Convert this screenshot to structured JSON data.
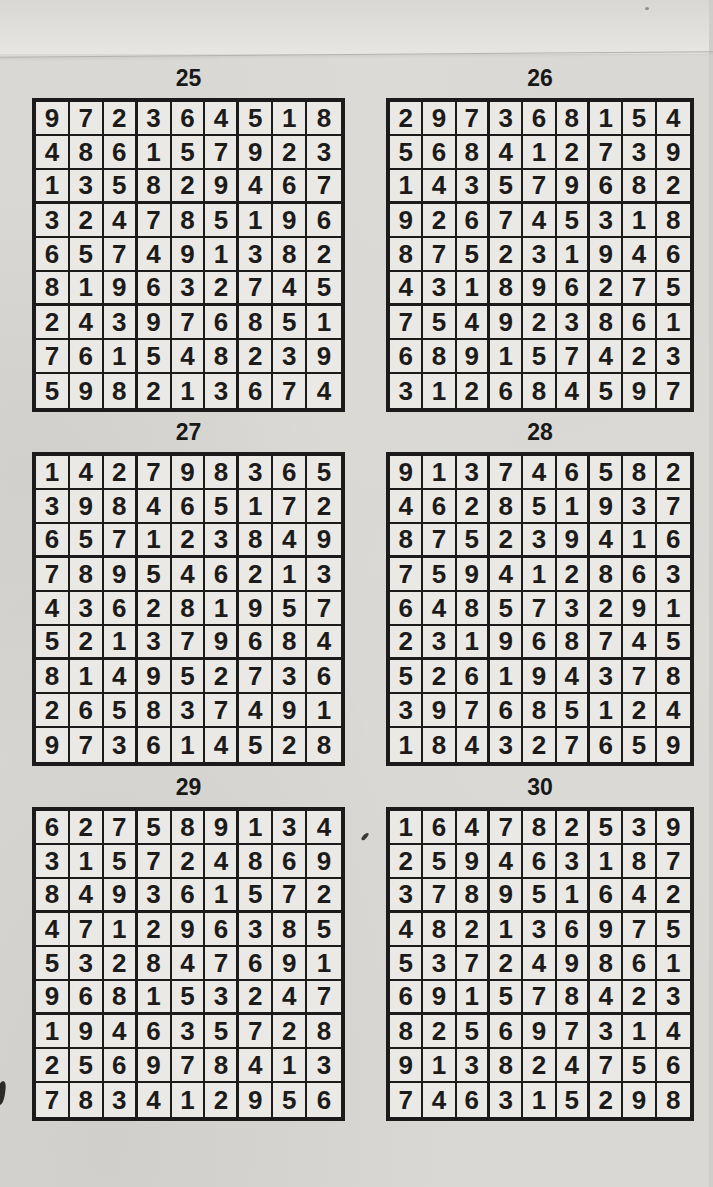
{
  "page": {
    "kind": "sudoku-solutions-page",
    "colors": {
      "paper": "#d9d8d5",
      "paper_top_band": "#e7e6e3",
      "ink": "#1b1b1b",
      "cell_fill": "#eae9e6"
    }
  },
  "puzzles": [
    {
      "number": "25",
      "rows": [
        [
          9,
          7,
          2,
          3,
          6,
          4,
          5,
          1,
          8
        ],
        [
          4,
          8,
          6,
          1,
          5,
          7,
          9,
          2,
          3
        ],
        [
          1,
          3,
          5,
          8,
          2,
          9,
          4,
          6,
          7
        ],
        [
          3,
          2,
          4,
          7,
          8,
          5,
          1,
          9,
          6
        ],
        [
          6,
          5,
          7,
          4,
          9,
          1,
          3,
          8,
          2
        ],
        [
          8,
          1,
          9,
          6,
          3,
          2,
          7,
          4,
          5
        ],
        [
          2,
          4,
          3,
          9,
          7,
          6,
          8,
          5,
          1
        ],
        [
          7,
          6,
          1,
          5,
          4,
          8,
          2,
          3,
          9
        ],
        [
          5,
          9,
          8,
          2,
          1,
          3,
          6,
          7,
          4
        ]
      ]
    },
    {
      "number": "26",
      "rows": [
        [
          2,
          9,
          7,
          3,
          6,
          8,
          1,
          5,
          4
        ],
        [
          5,
          6,
          8,
          4,
          1,
          2,
          7,
          3,
          9
        ],
        [
          1,
          4,
          3,
          5,
          7,
          9,
          6,
          8,
          2
        ],
        [
          9,
          2,
          6,
          7,
          4,
          5,
          3,
          1,
          8
        ],
        [
          8,
          7,
          5,
          2,
          3,
          1,
          9,
          4,
          6
        ],
        [
          4,
          3,
          1,
          8,
          9,
          6,
          2,
          7,
          5
        ],
        [
          7,
          5,
          4,
          9,
          2,
          3,
          8,
          6,
          1
        ],
        [
          6,
          8,
          9,
          1,
          5,
          7,
          4,
          2,
          3
        ],
        [
          3,
          1,
          2,
          6,
          8,
          4,
          5,
          9,
          7
        ]
      ]
    },
    {
      "number": "27",
      "rows": [
        [
          1,
          4,
          2,
          7,
          9,
          8,
          3,
          6,
          5
        ],
        [
          3,
          9,
          8,
          4,
          6,
          5,
          1,
          7,
          2
        ],
        [
          6,
          5,
          7,
          1,
          2,
          3,
          8,
          4,
          9
        ],
        [
          7,
          8,
          9,
          5,
          4,
          6,
          2,
          1,
          3
        ],
        [
          4,
          3,
          6,
          2,
          8,
          1,
          9,
          5,
          7
        ],
        [
          5,
          2,
          1,
          3,
          7,
          9,
          6,
          8,
          4
        ],
        [
          8,
          1,
          4,
          9,
          5,
          2,
          7,
          3,
          6
        ],
        [
          2,
          6,
          5,
          8,
          3,
          7,
          4,
          9,
          1
        ],
        [
          9,
          7,
          3,
          6,
          1,
          4,
          5,
          2,
          8
        ]
      ]
    },
    {
      "number": "28",
      "rows": [
        [
          9,
          1,
          3,
          7,
          4,
          6,
          5,
          8,
          2
        ],
        [
          4,
          6,
          2,
          8,
          5,
          1,
          9,
          3,
          7
        ],
        [
          8,
          7,
          5,
          2,
          3,
          9,
          4,
          1,
          6
        ],
        [
          7,
          5,
          9,
          4,
          1,
          2,
          8,
          6,
          3
        ],
        [
          6,
          4,
          8,
          5,
          7,
          3,
          2,
          9,
          1
        ],
        [
          2,
          3,
          1,
          9,
          6,
          8,
          7,
          4,
          5
        ],
        [
          5,
          2,
          6,
          1,
          9,
          4,
          3,
          7,
          8
        ],
        [
          3,
          9,
          7,
          6,
          8,
          5,
          1,
          2,
          4
        ],
        [
          1,
          8,
          4,
          3,
          2,
          7,
          6,
          5,
          9
        ]
      ]
    },
    {
      "number": "29",
      "rows": [
        [
          6,
          2,
          7,
          5,
          8,
          9,
          1,
          3,
          4
        ],
        [
          3,
          1,
          5,
          7,
          2,
          4,
          8,
          6,
          9
        ],
        [
          8,
          4,
          9,
          3,
          6,
          1,
          5,
          7,
          2
        ],
        [
          4,
          7,
          1,
          2,
          9,
          6,
          3,
          8,
          5
        ],
        [
          5,
          3,
          2,
          8,
          4,
          7,
          6,
          9,
          1
        ],
        [
          9,
          6,
          8,
          1,
          5,
          3,
          2,
          4,
          7
        ],
        [
          1,
          9,
          4,
          6,
          3,
          5,
          7,
          2,
          8
        ],
        [
          2,
          5,
          6,
          9,
          7,
          8,
          4,
          1,
          3
        ],
        [
          7,
          8,
          3,
          4,
          1,
          2,
          9,
          5,
          6
        ]
      ]
    },
    {
      "number": "30",
      "rows": [
        [
          1,
          6,
          4,
          7,
          8,
          2,
          5,
          3,
          9
        ],
        [
          2,
          5,
          9,
          4,
          6,
          3,
          1,
          8,
          7
        ],
        [
          3,
          7,
          8,
          9,
          5,
          1,
          6,
          4,
          2
        ],
        [
          4,
          8,
          2,
          1,
          3,
          6,
          9,
          7,
          5
        ],
        [
          5,
          3,
          7,
          2,
          4,
          9,
          8,
          6,
          1
        ],
        [
          6,
          9,
          1,
          5,
          7,
          8,
          4,
          2,
          3
        ],
        [
          8,
          2,
          5,
          6,
          9,
          7,
          3,
          1,
          4
        ],
        [
          9,
          1,
          3,
          8,
          2,
          4,
          7,
          5,
          6
        ],
        [
          7,
          4,
          6,
          3,
          1,
          5,
          2,
          9,
          8
        ]
      ]
    }
  ]
}
